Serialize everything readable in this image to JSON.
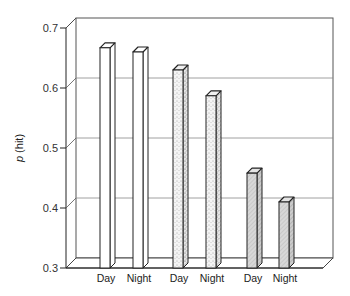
{
  "chart_data": {
    "type": "bar",
    "style": "3d",
    "title": "",
    "xlabel": "",
    "ylabel_italic": "p",
    "ylabel_rest": " (hit)",
    "ylim": [
      0.3,
      0.7
    ],
    "yticks": [
      0.3,
      0.4,
      0.5,
      0.6,
      0.7
    ],
    "ytick_labels": [
      "0.3",
      "0.4",
      "0.5",
      "0.6",
      "0.7"
    ],
    "grid": true,
    "categories": [
      "Day",
      "Night",
      "Day",
      "Night",
      "Day",
      "Night"
    ],
    "values": [
      0.667,
      0.66,
      0.63,
      0.587,
      0.458,
      0.41
    ],
    "groups": [
      {
        "name": "group-1",
        "fill": "plain",
        "bars": [
          0,
          1
        ]
      },
      {
        "name": "group-2",
        "fill": "stippled",
        "bars": [
          2,
          3
        ]
      },
      {
        "name": "group-3",
        "fill": "gray-hatched",
        "bars": [
          4,
          5
        ]
      }
    ],
    "colors": {
      "plain": "#ffffff",
      "stippled": "#efefef",
      "gray": "#d6d6d6",
      "line": "#222222",
      "grid": "#888888"
    }
  }
}
